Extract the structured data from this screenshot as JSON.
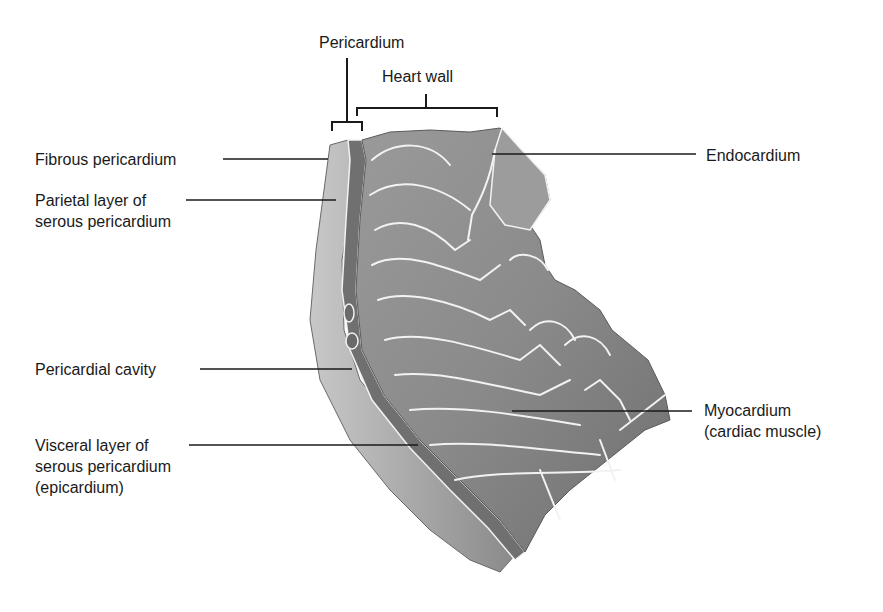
{
  "brackets": {
    "pericardium": "Pericardium",
    "heart_wall": "Heart wall"
  },
  "labels_left": {
    "fibrous": [
      "Fibrous pericardium"
    ],
    "parietal": [
      "Parietal layer of",
      "serous pericardium"
    ],
    "cavity": [
      "Pericardial cavity"
    ],
    "visceral": [
      "Visceral layer of",
      "serous pericardium",
      "(epicardium)"
    ]
  },
  "labels_right": {
    "endocardium": [
      "Endocardium"
    ],
    "myocardium": [
      "Myocardium",
      "(cardiac muscle)"
    ]
  },
  "colors": {
    "background": "#ffffff",
    "text": "#1a1a1a",
    "leader_line": "#1a1a1a",
    "tissue_dark": "#6e6e6e",
    "tissue_mid": "#8e8e8e",
    "tissue_light": "#b4b4b4",
    "highlight": "#f2f2f2"
  }
}
